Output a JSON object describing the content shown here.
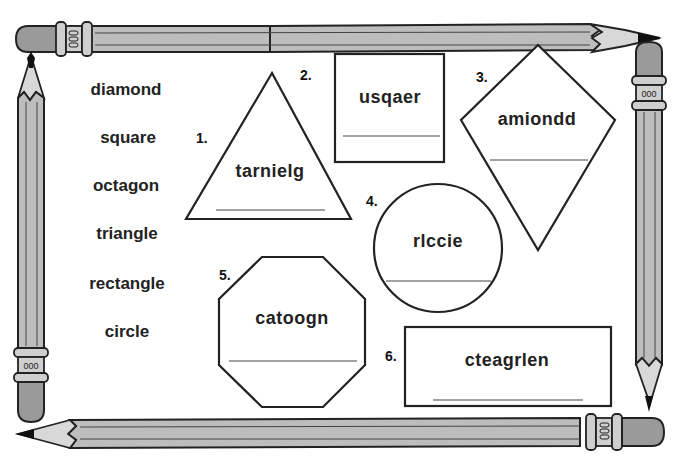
{
  "worksheet": {
    "word_bank": [
      "diamond",
      "square",
      "octagon",
      "triangle",
      "rectangle",
      "circle"
    ],
    "puzzles": [
      {
        "number": "1.",
        "shape": "triangle",
        "scrambled": "tarnielg",
        "answer": ""
      },
      {
        "number": "2.",
        "shape": "square",
        "scrambled": "usqaer",
        "answer": ""
      },
      {
        "number": "3.",
        "shape": "diamond",
        "scrambled": "amiondd",
        "answer": ""
      },
      {
        "number": "4.",
        "shape": "circle",
        "scrambled": "rlccie",
        "answer": ""
      },
      {
        "number": "5.",
        "shape": "octagon",
        "scrambled": "catoogn",
        "answer": ""
      },
      {
        "number": "6.",
        "shape": "rectangle",
        "scrambled": "cteagrlen",
        "answer": ""
      }
    ],
    "ferrule_marks": "000"
  },
  "colors": {
    "ink": "#222222",
    "pencil_body": "#bdbdbd",
    "eraser": "#9a9a9a",
    "background": "#ffffff"
  }
}
